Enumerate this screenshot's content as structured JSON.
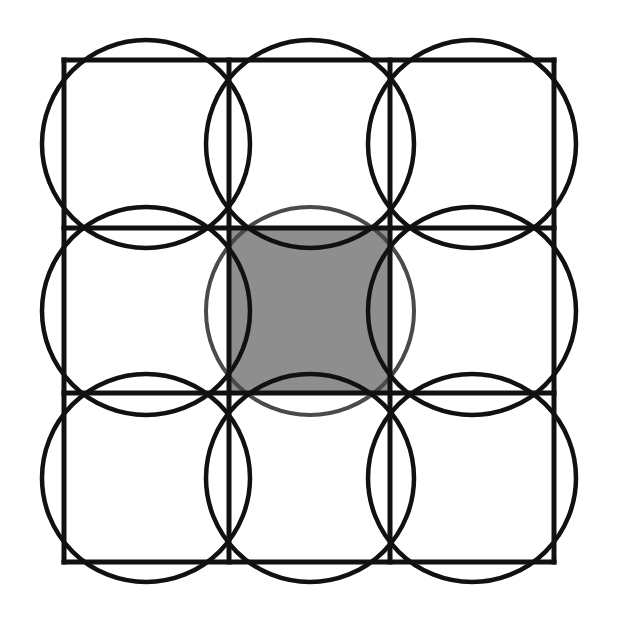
{
  "diagram": {
    "grid": {
      "rows": 3,
      "cols": 3,
      "x_lines": [
        64,
        229,
        390,
        554
      ],
      "y_lines": [
        60,
        228,
        393,
        562
      ],
      "stroke_color": "#111111",
      "stroke_width": 5
    },
    "circles": {
      "radius": 104,
      "stroke_color": "#111111",
      "stroke_width": 4.5,
      "centers": [
        {
          "id": "r1c1",
          "cx": 146,
          "cy": 144
        },
        {
          "id": "r1c2",
          "cx": 310,
          "cy": 144
        },
        {
          "id": "r1c3",
          "cx": 472,
          "cy": 144
        },
        {
          "id": "r2c1",
          "cx": 146,
          "cy": 311
        },
        {
          "id": "r2c3",
          "cx": 472,
          "cy": 311
        },
        {
          "id": "r3c1",
          "cx": 146,
          "cy": 478
        },
        {
          "id": "r3c2",
          "cx": 310,
          "cy": 478
        },
        {
          "id": "r3c3",
          "cx": 472,
          "cy": 478
        }
      ]
    },
    "center_cell": {
      "shaded": true,
      "fill_color": "#8e8e8e",
      "circle": {
        "cx": 310,
        "cy": 311,
        "r": 104,
        "stroke_color": "#4a4a4a",
        "stroke_width": 4
      }
    }
  }
}
